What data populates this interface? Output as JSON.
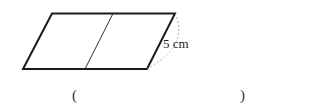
{
  "figure": {
    "shape": "parallelogram",
    "divider": "single slanted line parallel to sides, splitting into two congruent parallelograms",
    "side_label": "5 cm",
    "dashed_arc": "indicates right slanted side length"
  },
  "answer": {
    "open_paren": "(",
    "close_paren": ")",
    "value": ""
  }
}
